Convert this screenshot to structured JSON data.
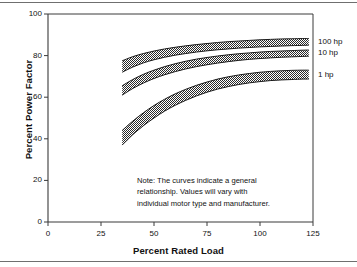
{
  "chart_data": {
    "type": "line",
    "title": "",
    "xlabel": "Percent Rated Load",
    "ylabel": "Percent Power Factor",
    "xlim": [
      0,
      125
    ],
    "ylim": [
      0,
      100
    ],
    "xticks": [
      0,
      25,
      50,
      75,
      100,
      125
    ],
    "yticks": [
      0,
      20,
      40,
      60,
      80,
      100
    ],
    "xtick_labels": [
      "0",
      "25",
      "50",
      "75",
      "100",
      "125"
    ],
    "ytick_labels": [
      "0",
      "20",
      "40",
      "60",
      "80",
      "100"
    ],
    "grid": false,
    "legend_position": "right-inline",
    "band_style": "checkerboard-dither-fill",
    "series": [
      {
        "name": "100 hp",
        "label": "100 hp",
        "x": [
          35,
          40,
          45,
          50,
          55,
          60,
          65,
          70,
          75,
          80,
          85,
          90,
          95,
          100,
          105,
          110,
          115,
          120,
          123
        ],
        "upper": [
          77.5,
          79.5,
          81.0,
          82.2,
          83.2,
          84.0,
          84.7,
          85.3,
          85.8,
          86.3,
          86.7,
          87.0,
          87.3,
          87.6,
          87.8,
          88.0,
          88.1,
          88.2,
          88.2
        ],
        "lower": [
          72.0,
          74.5,
          76.5,
          78.0,
          79.2,
          80.2,
          81.0,
          81.7,
          82.3,
          82.8,
          83.2,
          83.6,
          83.9,
          84.2,
          84.4,
          84.6,
          84.8,
          84.9,
          85.0
        ]
      },
      {
        "name": "10 hp",
        "label": "10 hp",
        "x": [
          35,
          40,
          45,
          50,
          55,
          60,
          65,
          70,
          75,
          80,
          85,
          90,
          95,
          100,
          105,
          110,
          115,
          120,
          123
        ],
        "upper": [
          65.5,
          68.5,
          71.0,
          73.0,
          74.7,
          76.1,
          77.3,
          78.3,
          79.1,
          79.8,
          80.4,
          80.9,
          81.3,
          81.7,
          82.0,
          82.2,
          82.4,
          82.6,
          82.7
        ],
        "lower": [
          61.0,
          64.2,
          66.8,
          69.0,
          70.8,
          72.3,
          73.6,
          74.7,
          75.6,
          76.4,
          77.1,
          77.7,
          78.2,
          78.6,
          78.9,
          79.2,
          79.4,
          79.6,
          79.7
        ]
      },
      {
        "name": "1 hp",
        "label": "1 hp",
        "x": [
          35,
          40,
          45,
          50,
          55,
          60,
          65,
          70,
          75,
          80,
          85,
          90,
          95,
          100,
          105,
          110,
          115,
          120,
          123
        ],
        "upper": [
          44.0,
          48.5,
          52.5,
          56.0,
          59.0,
          61.6,
          63.8,
          65.7,
          67.3,
          68.7,
          69.8,
          70.7,
          71.4,
          72.0,
          72.4,
          72.7,
          72.9,
          73.0,
          73.0
        ],
        "lower": [
          37.0,
          42.0,
          46.3,
          50.0,
          53.3,
          56.1,
          58.5,
          60.6,
          62.4,
          63.9,
          65.1,
          66.1,
          66.9,
          67.5,
          68.0,
          68.3,
          68.5,
          68.7,
          68.7
        ]
      }
    ],
    "annotation": {
      "lines": [
        "Note:  The curves indicate a general",
        "relationship.  Values will vary with",
        "individual motor type and manufacturer."
      ]
    },
    "colors": {
      "axis": "#3a3a3a",
      "band_fill": "#5a5a5a",
      "band_edge": "#1a1a1a",
      "text": "#111111",
      "background": "#ffffff",
      "rule": "#6f6f6f"
    }
  },
  "labels": {
    "y_axis_title": "Percent Power Factor",
    "x_axis_title": "Percent Rated Load"
  }
}
